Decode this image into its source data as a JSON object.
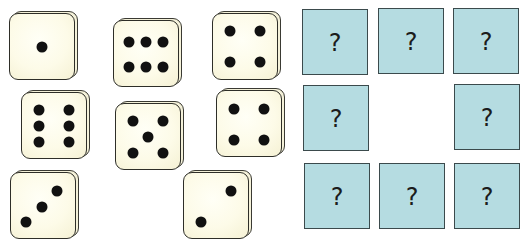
{
  "dice": [
    {
      "value": 1,
      "left": 9,
      "top": 13,
      "pips": [
        [
          50,
          50
        ]
      ]
    },
    {
      "value": 6,
      "left": 113,
      "top": 20,
      "pips": [
        [
          24,
          32
        ],
        [
          50,
          32
        ],
        [
          76,
          32
        ],
        [
          24,
          70
        ],
        [
          50,
          70
        ],
        [
          76,
          70
        ]
      ]
    },
    {
      "value": 4,
      "left": 212,
      "top": 13,
      "pips": [
        [
          26,
          26
        ],
        [
          74,
          26
        ],
        [
          26,
          74
        ],
        [
          74,
          74
        ]
      ]
    },
    {
      "value": 6,
      "left": 21,
      "top": 92,
      "pips": [
        [
          26,
          26
        ],
        [
          74,
          26
        ],
        [
          26,
          50
        ],
        [
          74,
          50
        ],
        [
          26,
          76
        ],
        [
          74,
          76
        ]
      ]
    },
    {
      "value": 5,
      "left": 115,
      "top": 103,
      "pips": [
        [
          26,
          26
        ],
        [
          74,
          26
        ],
        [
          50,
          50
        ],
        [
          26,
          76
        ],
        [
          74,
          76
        ]
      ]
    },
    {
      "value": 4,
      "left": 216,
      "top": 90,
      "pips": [
        [
          26,
          28
        ],
        [
          74,
          28
        ],
        [
          26,
          76
        ],
        [
          74,
          76
        ]
      ]
    },
    {
      "value": 3,
      "left": 10,
      "top": 172,
      "pips": [
        [
          72,
          28
        ],
        [
          48,
          52
        ],
        [
          24,
          76
        ]
      ]
    },
    {
      "value": 2,
      "left": 183,
      "top": 172,
      "pips": [
        [
          74,
          28
        ],
        [
          26,
          76
        ]
      ]
    }
  ],
  "question_boxes": [
    {
      "label": "?",
      "left": 302,
      "top": 9
    },
    {
      "label": "?",
      "left": 378,
      "top": 8
    },
    {
      "label": "?",
      "left": 453,
      "top": 8
    },
    {
      "label": "?",
      "left": 303,
      "top": 85
    },
    {
      "label": "?",
      "left": 454,
      "top": 84
    },
    {
      "label": "?",
      "left": 304,
      "top": 163
    },
    {
      "label": "?",
      "left": 379,
      "top": 163
    },
    {
      "label": "?",
      "left": 454,
      "top": 163
    }
  ],
  "colors": {
    "die_face": "#fdfbe8",
    "die_outline": "#2e2e28",
    "pip": "#111111",
    "question_box": "#b5dce1",
    "question_box_border": "#3b4a4c",
    "question_mark": "#1c1c1c"
  }
}
